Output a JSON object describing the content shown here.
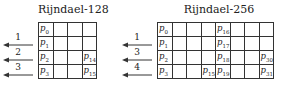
{
  "diagrams": [
    {
      "title": "Rijndael-128",
      "rows": [
        [
          {
            "v": "p",
            "s": "0"
          },
          {
            "v": "",
            "s": ""
          },
          {
            "v": "",
            "s": ""
          },
          {
            "v": "",
            "s": ""
          }
        ],
        [
          {
            "v": "p",
            "s": "1"
          },
          {
            "v": "",
            "s": ""
          },
          {
            "v": "",
            "s": ""
          },
          {
            "v": "",
            "s": ""
          }
        ],
        [
          {
            "v": "p",
            "s": "2"
          },
          {
            "v": "",
            "s": ""
          },
          {
            "v": "",
            "s": ""
          },
          {
            "v": "p",
            "s": "14"
          }
        ],
        [
          {
            "v": "p",
            "s": "3"
          },
          {
            "v": "",
            "s": ""
          },
          {
            "v": "",
            "s": ""
          },
          {
            "v": "p",
            "s": "15"
          }
        ]
      ],
      "shifts": [
        "1",
        "2",
        "3"
      ]
    },
    {
      "title": "Rijndael-256",
      "rows": [
        [
          {
            "v": "p",
            "s": "0"
          },
          {
            "v": "",
            "s": ""
          },
          {
            "v": "",
            "s": ""
          },
          {
            "v": "",
            "s": ""
          },
          {
            "v": "p",
            "s": "16"
          },
          {
            "v": "",
            "s": ""
          },
          {
            "v": "",
            "s": ""
          },
          {
            "v": "",
            "s": ""
          }
        ],
        [
          {
            "v": "p",
            "s": "1"
          },
          {
            "v": "",
            "s": ""
          },
          {
            "v": "",
            "s": ""
          },
          {
            "v": "",
            "s": ""
          },
          {
            "v": "p",
            "s": "17"
          },
          {
            "v": "",
            "s": ""
          },
          {
            "v": "",
            "s": ""
          },
          {
            "v": "",
            "s": ""
          }
        ],
        [
          {
            "v": "p",
            "s": "2"
          },
          {
            "v": "",
            "s": ""
          },
          {
            "v": "",
            "s": ""
          },
          {
            "v": "",
            "s": ""
          },
          {
            "v": "p",
            "s": "18"
          },
          {
            "v": "",
            "s": ""
          },
          {
            "v": "",
            "s": ""
          },
          {
            "v": "p",
            "s": "30"
          }
        ],
        [
          {
            "v": "p",
            "s": "3"
          },
          {
            "v": "",
            "s": ""
          },
          {
            "v": "",
            "s": ""
          },
          {
            "v": "p",
            "s": "15"
          },
          {
            "v": "p",
            "s": "19"
          },
          {
            "v": "",
            "s": ""
          },
          {
            "v": "",
            "s": ""
          },
          {
            "v": "p",
            "s": "31"
          }
        ]
      ],
      "shifts": [
        "1",
        "3",
        "4"
      ]
    }
  ],
  "colors": {
    "line": "#333333",
    "text": "#222222",
    "background": "#ffffff"
  }
}
